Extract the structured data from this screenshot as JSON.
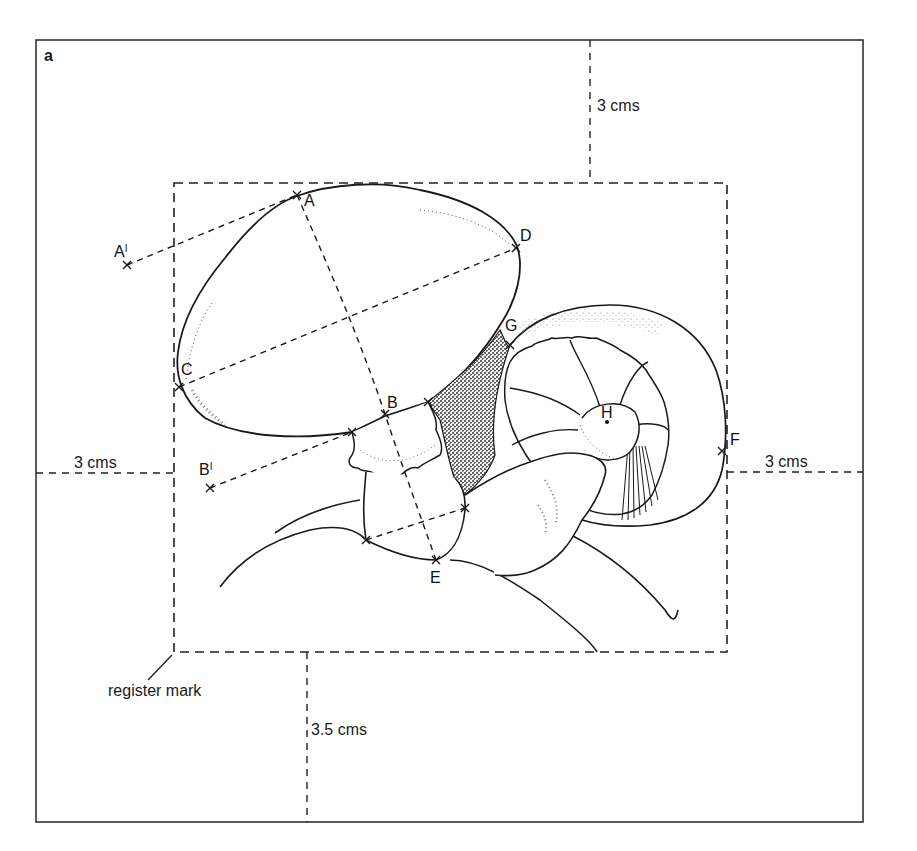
{
  "figure": {
    "panel_label": "a",
    "colors": {
      "ink": "#1a1a1a",
      "background": "#ffffff",
      "stipple": "#222222"
    }
  },
  "measurements": {
    "top": "3 cms",
    "left": "3 cms",
    "right": "3 cms",
    "bottom": "3.5 cms"
  },
  "callouts": {
    "register_mark": "register mark"
  },
  "points": {
    "A": "A",
    "A_prime": "A",
    "A_prime_mark": "I",
    "B": "B",
    "B_prime": "B",
    "B_prime_mark": "I",
    "C": "C",
    "D": "D",
    "E": "E",
    "F": "F",
    "G": "G",
    "H": "H"
  }
}
